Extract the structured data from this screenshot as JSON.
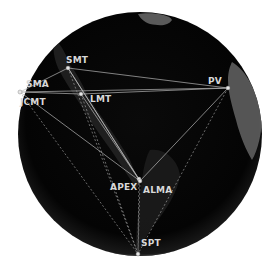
{
  "diagram": {
    "type": "baseline-network-globe",
    "globe": {
      "cx": 140,
      "cy": 134,
      "r": 122,
      "fill": "#050505",
      "land": "#5a5a5a"
    },
    "colors": {
      "line": "#bdbdbd",
      "dashed": "#9a9a9a",
      "label": "#d8d8d8",
      "dot": "#e6e6e6"
    },
    "stations": [
      {
        "id": "PV",
        "label": "PV",
        "x": 228,
        "y": 88,
        "lx": 208,
        "ly": 84
      },
      {
        "id": "SMT",
        "label": "SMT",
        "x": 68,
        "y": 68,
        "lx": 66,
        "ly": 63
      },
      {
        "id": "SMA",
        "label": "SMA",
        "x": 20,
        "y": 92,
        "lx": 26,
        "ly": 87
      },
      {
        "id": "JCMT",
        "label": "JCMT",
        "x": 20,
        "y": 92,
        "lx": 20,
        "ly": 105
      },
      {
        "id": "LMT",
        "label": "LMT",
        "x": 81,
        "y": 94,
        "lx": 90,
        "ly": 102
      },
      {
        "id": "APEX",
        "label": "APEX",
        "x": 139,
        "y": 179,
        "lx": 110,
        "ly": 190
      },
      {
        "id": "ALMA",
        "label": "ALMA",
        "x": 140,
        "y": 181,
        "lx": 143,
        "ly": 193
      },
      {
        "id": "SPT",
        "label": "SPT",
        "x": 138,
        "y": 254,
        "lx": 141,
        "ly": 246
      }
    ],
    "solid_baselines": [
      [
        "SMT",
        "PV"
      ],
      [
        "SMA",
        "PV"
      ],
      [
        "LMT",
        "PV"
      ],
      [
        "SMA",
        "SMT"
      ],
      [
        "SMA",
        "LMT"
      ],
      [
        "SMT",
        "ALMA"
      ],
      [
        "LMT",
        "ALMA"
      ],
      [
        "PV",
        "ALMA"
      ],
      [
        "JCMT",
        "ALMA"
      ],
      [
        "SMT",
        "APEX"
      ]
    ],
    "dashed_baselines": [
      [
        "JCMT",
        "SPT"
      ],
      [
        "SMT",
        "SPT"
      ],
      [
        "LMT",
        "SPT"
      ],
      [
        "PV",
        "SPT"
      ],
      [
        "ALMA",
        "SPT"
      ],
      [
        "APEX",
        "SPT"
      ]
    ]
  }
}
